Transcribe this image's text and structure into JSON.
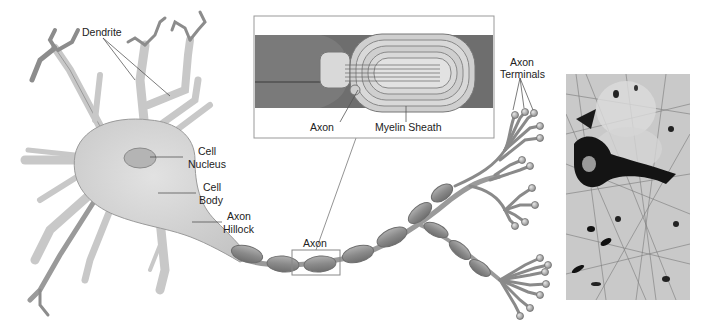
{
  "figure": {
    "labels": {
      "dendrite": "Dendrite",
      "cell_nucleus_line1": "Cell",
      "cell_nucleus_line2": "Nucleus",
      "cell_body_line1": "Cell",
      "cell_body_line2": "Body",
      "axon_hillock_line1": "Axon",
      "axon_hillock_line2": "Hillock",
      "axon": "Axon",
      "axon_terminals_line1": "Axon",
      "axon_terminals_line2": "Terminals"
    },
    "inset": {
      "labels": {
        "axon": "Axon",
        "myelin_sheath": "Myelin Sheath"
      }
    },
    "micrograph": {
      "description": "Stained neuron tissue micrograph"
    }
  },
  "colors": {
    "cell_fill": "#d2d2d2",
    "cell_stroke": "#8a8a8a",
    "myelin_fill": "#8f8f8f",
    "inset_dark": "#6e6e6e",
    "inset_light": "#d9d9d9",
    "label_text": "#222222"
  }
}
